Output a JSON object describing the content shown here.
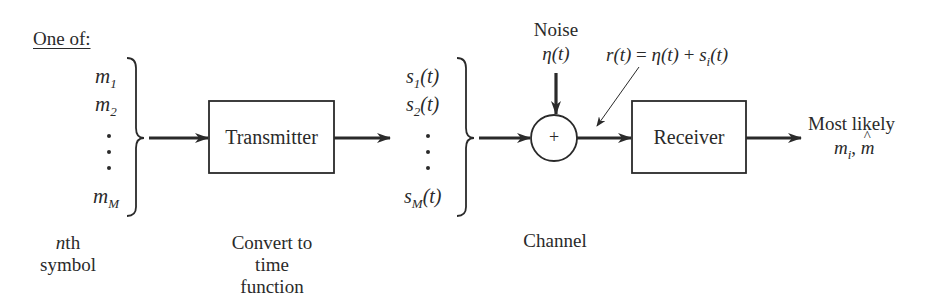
{
  "diagram": {
    "source_set": {
      "heading": "One of:",
      "symbols": [
        {
          "base": "m",
          "sub": "1"
        },
        {
          "base": "m",
          "sub": "2"
        },
        {
          "base": "m",
          "sub": "M"
        }
      ],
      "caption_line1": "nth",
      "caption_line1_italic": "n",
      "caption_line1_rest": "th",
      "caption_line2": "symbol"
    },
    "transmitter": {
      "label": "Transmitter",
      "caption": [
        "Convert to",
        "time",
        "function"
      ]
    },
    "signal_set": {
      "symbols": [
        {
          "base": "s",
          "sub": "1",
          "arg": "(t)"
        },
        {
          "base": "s",
          "sub": "2",
          "arg": "(t)"
        },
        {
          "base": "s",
          "sub": "M",
          "arg": "(t)"
        }
      ]
    },
    "channel": {
      "noise_label": "Noise",
      "noise_symbol": "η(t)",
      "adder_symbol": "+",
      "caption": "Channel",
      "received_signal": {
        "lhs": "r(t)",
        "eq": "=",
        "term1": "η(t)",
        "plus": "+",
        "term2_base": "s",
        "term2_sub": "i",
        "term2_arg": "(t)"
      }
    },
    "receiver": {
      "label": "Receiver"
    },
    "output": {
      "line1": "Most likely",
      "m_base": "m",
      "m_sub": "i",
      "sep": ",",
      "m_hat": "m"
    },
    "colors": {
      "ink": "#2a2a2a",
      "background": "#ffffff"
    }
  }
}
